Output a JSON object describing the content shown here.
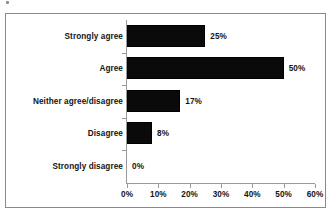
{
  "chart_data": {
    "type": "bar",
    "orientation": "horizontal",
    "title": "",
    "xlabel": "",
    "ylabel": "",
    "categories": [
      "Strongly agree",
      "Agree",
      "Neither agree/disagree",
      "Disagree",
      "Strongly disagree"
    ],
    "values": [
      25,
      50,
      17,
      8,
      0
    ],
    "data_labels": [
      "25%",
      "50%",
      "17%",
      "8%",
      "0%"
    ],
    "xlim": [
      0,
      60
    ],
    "xticks": [
      0,
      10,
      20,
      30,
      40,
      50,
      60
    ],
    "xtick_labels": [
      "0%",
      "10%",
      "20%",
      "30%",
      "40%",
      "50%",
      "60%"
    ],
    "grid": false,
    "legend": false,
    "bar_color": "#0a0a0a",
    "axis_color": "#9a9a9a",
    "frame_color": "#8a8a8a",
    "text_color": "#141414"
  }
}
